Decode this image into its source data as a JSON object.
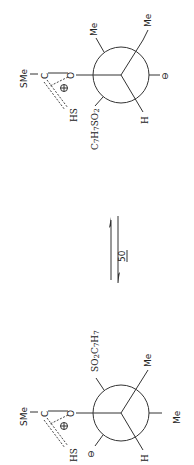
{
  "diagram": {
    "type": "Newman projection equilibrium",
    "compound_number": "50",
    "equilibrium_symbol": "⇌",
    "top_structure": {
      "acyl_group": {
        "sme": "SMe",
        "carbon": "C",
        "charge": "⊕",
        "hs": "HS",
        "oxygen": "O"
      },
      "front_substituents": {
        "oxygen_link": "O",
        "bottom_left": "C7H7SO2",
        "right": "H"
      },
      "back_substituents": {
        "top": "Me",
        "top_right": "Me",
        "right": "⊖"
      },
      "labels": {
        "c7h7so2": "C7H7SO2",
        "me1": "Me",
        "me2": "Me",
        "minus": "⊖",
        "h": "H"
      }
    },
    "bottom_structure": {
      "acyl_group": {
        "sme": "SMe",
        "carbon": "C",
        "charge": "⊕",
        "hs": "HS",
        "oxygen": "O"
      },
      "labels": {
        "so2c7h7": "SO2C7H7",
        "me1": "Me",
        "me2": "Me",
        "minus": "⊖",
        "h": "H"
      }
    }
  }
}
